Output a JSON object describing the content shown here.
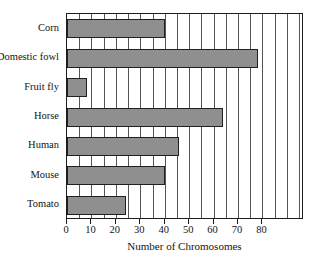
{
  "chart_data": {
    "type": "bar",
    "orientation": "horizontal",
    "title": "",
    "xlabel": "Number of Chromosomes",
    "ylabel": "",
    "categories": [
      "Corn",
      "Domestic fowl",
      "Fruit fly",
      "Horse",
      "Human",
      "Mouse",
      "Tomato"
    ],
    "values": [
      40,
      78,
      8,
      64,
      46,
      40,
      24
    ],
    "xlim": [
      0,
      97
    ],
    "xticks": [
      0,
      10,
      20,
      30,
      40,
      50,
      60,
      70,
      80
    ],
    "xticklabels": [
      "0",
      "10",
      "20",
      "30",
      "40",
      "50",
      "60",
      "70",
      "80"
    ],
    "gridline_interval": 5,
    "grid": true,
    "legend": null,
    "bar_fill_color": "#8f8f8f",
    "bar_border_color": "#1f1f1f",
    "frame_color": "#1c1c1c",
    "gridline_color": "#555555",
    "background_color": "#ffffff"
  },
  "title_fragment": "ㅡ"
}
